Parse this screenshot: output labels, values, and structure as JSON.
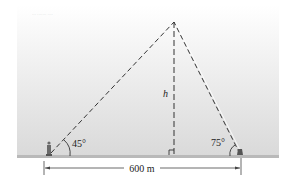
{
  "figure": {
    "header_text": "··· ·······  ····",
    "height_label": "h",
    "left_angle_label": "45°",
    "right_angle_label": "75°",
    "distance_label": "600 m"
  },
  "colors": {
    "sky_top": "#ffffff",
    "sky_bottom": "#dcdcdc",
    "ground": "#b9b9b9",
    "line": "#333333"
  },
  "geometry": {
    "apex": [
      174,
      22
    ],
    "left_observer": [
      49,
      155
    ],
    "right_observer": [
      240,
      155
    ],
    "foot_of_height": [
      174,
      155
    ],
    "left_angle_deg": 45,
    "right_angle_deg": 75,
    "baseline_m": 600
  }
}
